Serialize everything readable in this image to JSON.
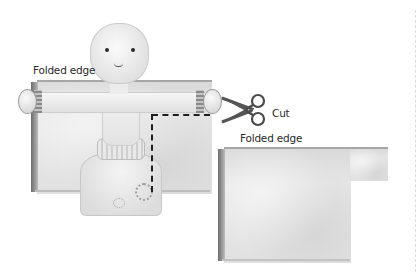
{
  "illustration": {
    "labels": {
      "folded_edge_top": "Folded edge",
      "folded_edge_bottom": "Folded edge",
      "cut": "Cut"
    },
    "icons": {
      "scissors": "scissors-icon"
    },
    "colors": {
      "paper": "#e1e1e1",
      "paper_edge": "#7a7a7a",
      "cut_line": "#1e1e1e",
      "scissors": "#5a5a5a",
      "text": "#2a2a2a"
    }
  }
}
